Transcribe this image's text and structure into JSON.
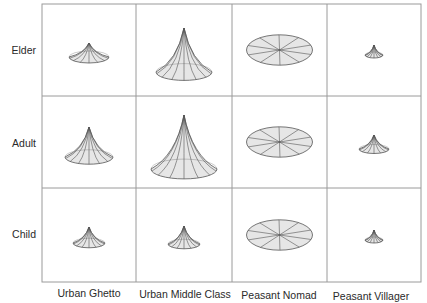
{
  "chart_data": {
    "type": "small-multiples-glyph",
    "title": "",
    "rows": [
      "Elder",
      "Adult",
      "Child"
    ],
    "columns": [
      "Urban Ghetto",
      "Urban Middle Class",
      "Peasant Nomad",
      "Peasant Villager"
    ],
    "glyph": "cone (tent shape): width = base spread, height = peak height; flat ellipse = zero height",
    "cells": [
      {
        "row": "Elder",
        "column": "Urban Ghetto",
        "width": 40,
        "height": 14
      },
      {
        "row": "Elder",
        "column": "Urban Middle Class",
        "width": 56,
        "height": 44
      },
      {
        "row": "Elder",
        "column": "Peasant Nomad",
        "width": 66,
        "height": 0
      },
      {
        "row": "Elder",
        "column": "Peasant Villager",
        "width": 18,
        "height": 10
      },
      {
        "row": "Adult",
        "column": "Urban Ghetto",
        "width": 48,
        "height": 30
      },
      {
        "row": "Adult",
        "column": "Urban Middle Class",
        "width": 66,
        "height": 54
      },
      {
        "row": "Adult",
        "column": "Peasant Nomad",
        "width": 66,
        "height": 0
      },
      {
        "row": "Adult",
        "column": "Peasant Villager",
        "width": 30,
        "height": 14
      },
      {
        "row": "Child",
        "column": "Urban Ghetto",
        "width": 32,
        "height": 16
      },
      {
        "row": "Child",
        "column": "Urban Middle Class",
        "width": 32,
        "height": 18
      },
      {
        "row": "Child",
        "column": "Peasant Nomad",
        "width": 66,
        "height": 0
      },
      {
        "row": "Child",
        "column": "Peasant Villager",
        "width": 18,
        "height": 10
      }
    ],
    "grid": true,
    "legend": "none",
    "fill_color": "#e6e6e6",
    "stroke_color": "#555555",
    "grid_color": "#9a9a9a"
  },
  "labels": {
    "rows": [
      "Elder",
      "Adult",
      "Child"
    ],
    "columns": [
      "Urban Ghetto",
      "Urban Middle Class",
      "Peasant Nomad",
      "Peasant Villager"
    ]
  }
}
